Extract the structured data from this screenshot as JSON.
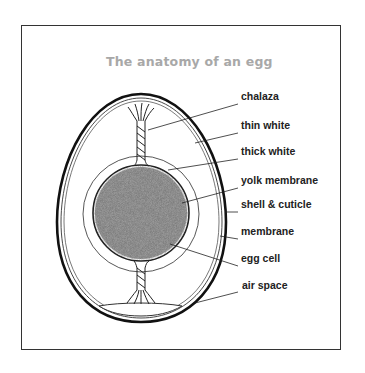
{
  "title": "The anatomy of an egg",
  "labels": [
    {
      "id": "chalaza",
      "text": "chalaza",
      "x": 241,
      "y": 96
    },
    {
      "id": "thin-white",
      "text": "thin white",
      "x": 241,
      "y": 125
    },
    {
      "id": "thick-white",
      "text": "thick white",
      "x": 241,
      "y": 151
    },
    {
      "id": "yolk-membrane",
      "text": "yolk membrane",
      "x": 241,
      "y": 180
    },
    {
      "id": "shell-cuticle",
      "text": "shell & cuticle",
      "x": 241,
      "y": 204
    },
    {
      "id": "membrane",
      "text": "membrane",
      "x": 241,
      "y": 231
    },
    {
      "id": "egg-cell",
      "text": "egg cell",
      "x": 241,
      "y": 258
    },
    {
      "id": "air-space",
      "text": "air space",
      "x": 242,
      "y": 285
    }
  ],
  "colors": {
    "title": "#a8a8a8",
    "line": "#222222",
    "yolk": "#8a8a8a"
  }
}
